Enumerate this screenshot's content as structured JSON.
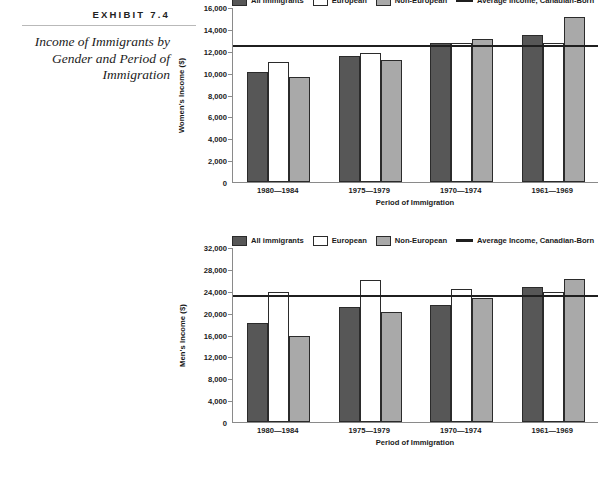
{
  "caption": {
    "exhibit_label": "EXHIBIT 7.4",
    "title": "Income of Immigrants by Gender and Period of Immigration"
  },
  "legend": {
    "items": [
      {
        "label": "All immigrants",
        "swatch": "dark-gray-swatch",
        "color": "#575757"
      },
      {
        "label": "European",
        "swatch": "white-swatch",
        "color": "#ffffff"
      },
      {
        "label": "Non-European",
        "swatch": "light-gray-swatch",
        "color": "#a9a9a9"
      },
      {
        "label": "Average Income, Canadian-Born",
        "swatch": "black-line-swatch",
        "color": "#1f1f1f"
      }
    ]
  },
  "chart_data": [
    {
      "type": "bar",
      "name": "women-income-chart",
      "title": "",
      "xlabel": "Period of Immigration",
      "ylabel": "Women's Income ($)",
      "categories": [
        "1980—1984",
        "1975—1979",
        "1970—1974",
        "1961—1969"
      ],
      "series": [
        {
          "name": "All immigrants",
          "color": "#575757",
          "values": [
            10100,
            11500,
            12700,
            13400
          ]
        },
        {
          "name": "European",
          "color": "#ffffff",
          "values": [
            11000,
            11800,
            12750,
            12700
          ]
        },
        {
          "name": "Non-European",
          "color": "#a9a9a9",
          "values": [
            9600,
            11200,
            13100,
            15100
          ]
        }
      ],
      "reference_line": {
        "label": "Average Income, Canadian-Born",
        "value": 12600,
        "color": "#1f1f1f"
      },
      "ylim": [
        0,
        16000
      ],
      "ytick_step": 2000,
      "yticks": [
        "0",
        "2,000",
        "4,000",
        "6,000",
        "8,000",
        "10,000",
        "12,000",
        "14,000",
        "16,000"
      ],
      "grid": false,
      "legend_position": "top"
    },
    {
      "type": "bar",
      "name": "men-income-chart",
      "title": "",
      "xlabel": "Period of Immigration",
      "ylabel": "Men's Income ($)",
      "categories": [
        "1980—1984",
        "1975—1979",
        "1970—1974",
        "1961—1969"
      ],
      "series": [
        {
          "name": "All immigrants",
          "color": "#575757",
          "values": [
            18100,
            21000,
            21400,
            24600
          ]
        },
        {
          "name": "European",
          "color": "#ffffff",
          "values": [
            23800,
            26000,
            24300,
            23700
          ]
        },
        {
          "name": "Non-European",
          "color": "#a9a9a9",
          "values": [
            15700,
            20200,
            22700,
            26100
          ]
        }
      ],
      "reference_line": {
        "label": "Average Income, Canadian-Born",
        "value": 23400,
        "color": "#1f1f1f"
      },
      "ylim": [
        0,
        32000
      ],
      "ytick_step": 4000,
      "yticks": [
        "0",
        "4,000",
        "8,000",
        "12,000",
        "16,000",
        "20,000",
        "24,000",
        "28,000",
        "32,000"
      ],
      "grid": false,
      "legend_position": "top"
    }
  ]
}
